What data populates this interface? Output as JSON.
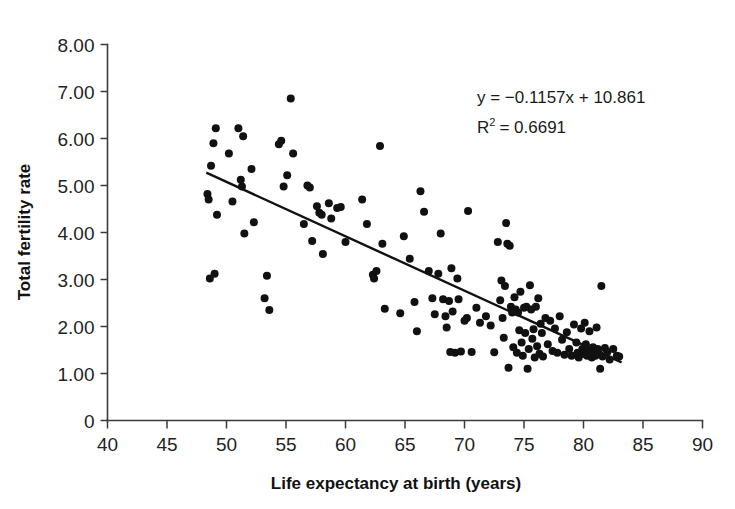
{
  "chart_data": {
    "type": "scatter",
    "title": "",
    "xlabel": "Life expectancy at birth (years)",
    "ylabel": "Total fertility rate",
    "xlim": [
      40,
      90
    ],
    "ylim": [
      0,
      8
    ],
    "xticks": [
      40,
      45,
      50,
      55,
      60,
      65,
      70,
      75,
      80,
      85,
      90
    ],
    "xtick_labels": [
      "40",
      "45",
      "50",
      "55",
      "60",
      "65",
      "70",
      "75",
      "80",
      "85",
      "90"
    ],
    "yticks": [
      0,
      1,
      2,
      3,
      4,
      5,
      6,
      7,
      8
    ],
    "ytick_labels": [
      "0",
      "1.00",
      "2.00",
      "3.00",
      "4.00",
      "5.00",
      "6.00",
      "7.00",
      "8.00"
    ],
    "grid": false,
    "legend": "none",
    "annotations": {
      "equation": "y = −0.1157x + 10.861",
      "equation_slope": -0.1157,
      "equation_intercept": 10.861,
      "r_squared_prefix": "R",
      "r_squared_exponent": "2",
      "r_squared_text": "= 0.6691",
      "r_squared_value": 0.6691
    },
    "trendline": {
      "type": "linear",
      "slope": -0.1157,
      "intercept": 10.861,
      "x_start": 48.3,
      "x_end": 83.2
    },
    "marker": {
      "shape": "circle",
      "color": "#111111",
      "size_px": 8
    },
    "points": [
      [
        48.4,
        4.82
      ],
      [
        48.5,
        4.7
      ],
      [
        48.6,
        3.02
      ],
      [
        48.7,
        5.42
      ],
      [
        48.9,
        5.9
      ],
      [
        49.0,
        3.12
      ],
      [
        49.1,
        6.22
      ],
      [
        49.2,
        4.38
      ],
      [
        50.2,
        5.68
      ],
      [
        50.5,
        4.66
      ],
      [
        51.0,
        6.22
      ],
      [
        51.2,
        5.12
      ],
      [
        51.3,
        4.98
      ],
      [
        51.4,
        6.05
      ],
      [
        51.5,
        3.98
      ],
      [
        52.1,
        5.35
      ],
      [
        52.3,
        4.22
      ],
      [
        53.2,
        2.6
      ],
      [
        53.4,
        3.08
      ],
      [
        53.6,
        2.35
      ],
      [
        54.4,
        5.88
      ],
      [
        54.6,
        5.95
      ],
      [
        54.8,
        4.98
      ],
      [
        55.1,
        5.22
      ],
      [
        55.4,
        6.85
      ],
      [
        55.6,
        5.68
      ],
      [
        56.5,
        4.18
      ],
      [
        56.8,
        5.0
      ],
      [
        57.0,
        4.96
      ],
      [
        57.2,
        3.82
      ],
      [
        57.6,
        4.56
      ],
      [
        57.8,
        4.42
      ],
      [
        58.0,
        4.38
      ],
      [
        58.1,
        3.54
      ],
      [
        58.6,
        4.62
      ],
      [
        58.8,
        4.3
      ],
      [
        59.3,
        4.52
      ],
      [
        59.6,
        4.54
      ],
      [
        60.0,
        3.8
      ],
      [
        61.4,
        4.7
      ],
      [
        61.8,
        4.18
      ],
      [
        62.3,
        3.1
      ],
      [
        62.4,
        3.02
      ],
      [
        62.6,
        3.18
      ],
      [
        62.9,
        5.84
      ],
      [
        63.1,
        3.76
      ],
      [
        63.3,
        2.38
      ],
      [
        64.6,
        2.28
      ],
      [
        64.9,
        3.92
      ],
      [
        65.4,
        3.44
      ],
      [
        65.8,
        2.52
      ],
      [
        66.0,
        1.9
      ],
      [
        66.3,
        4.88
      ],
      [
        66.6,
        4.44
      ],
      [
        67.0,
        3.18
      ],
      [
        67.3,
        2.6
      ],
      [
        67.5,
        2.26
      ],
      [
        67.8,
        3.12
      ],
      [
        68.0,
        3.98
      ],
      [
        68.2,
        2.58
      ],
      [
        68.4,
        2.22
      ],
      [
        68.5,
        1.98
      ],
      [
        68.7,
        2.54
      ],
      [
        68.8,
        1.46
      ],
      [
        68.9,
        3.24
      ],
      [
        69.0,
        2.32
      ],
      [
        69.2,
        1.44
      ],
      [
        69.4,
        3.02
      ],
      [
        69.5,
        2.58
      ],
      [
        69.7,
        1.47
      ],
      [
        70.0,
        2.12
      ],
      [
        70.2,
        2.18
      ],
      [
        70.3,
        4.46
      ],
      [
        70.6,
        1.46
      ],
      [
        71.0,
        2.4
      ],
      [
        71.3,
        2.08
      ],
      [
        71.8,
        2.22
      ],
      [
        72.2,
        2.02
      ],
      [
        72.5,
        1.45
      ],
      [
        72.8,
        3.8
      ],
      [
        73.0,
        2.56
      ],
      [
        73.1,
        2.98
      ],
      [
        73.2,
        2.18
      ],
      [
        73.3,
        1.76
      ],
      [
        73.4,
        2.86
      ],
      [
        73.5,
        4.2
      ],
      [
        73.6,
        3.76
      ],
      [
        73.7,
        1.12
      ],
      [
        73.8,
        3.72
      ],
      [
        73.9,
        2.42
      ],
      [
        74.0,
        2.3
      ],
      [
        74.1,
        1.56
      ],
      [
        74.2,
        2.62
      ],
      [
        74.3,
        2.36
      ],
      [
        74.4,
        1.44
      ],
      [
        74.5,
        2.3
      ],
      [
        74.6,
        1.92
      ],
      [
        74.7,
        2.74
      ],
      [
        74.8,
        1.66
      ],
      [
        74.9,
        1.38
      ],
      [
        75.0,
        2.4
      ],
      [
        75.1,
        1.86
      ],
      [
        75.2,
        2.42
      ],
      [
        75.3,
        1.1
      ],
      [
        75.4,
        1.52
      ],
      [
        75.5,
        2.88
      ],
      [
        75.6,
        2.36
      ],
      [
        75.7,
        1.74
      ],
      [
        75.8,
        1.94
      ],
      [
        75.9,
        1.34
      ],
      [
        76.0,
        2.42
      ],
      [
        76.1,
        1.58
      ],
      [
        76.2,
        2.6
      ],
      [
        76.3,
        1.42
      ],
      [
        76.4,
        2.06
      ],
      [
        76.5,
        1.86
      ],
      [
        76.6,
        1.36
      ],
      [
        76.8,
        2.18
      ],
      [
        77.0,
        1.62
      ],
      [
        77.2,
        2.12
      ],
      [
        77.4,
        1.48
      ],
      [
        77.6,
        1.96
      ],
      [
        77.8,
        1.44
      ],
      [
        78.0,
        2.22
      ],
      [
        78.2,
        1.72
      ],
      [
        78.4,
        1.4
      ],
      [
        78.6,
        1.88
      ],
      [
        78.8,
        1.52
      ],
      [
        79.0,
        1.38
      ],
      [
        79.2,
        2.04
      ],
      [
        79.4,
        1.66
      ],
      [
        79.5,
        1.44
      ],
      [
        79.6,
        1.34
      ],
      [
        79.8,
        1.96
      ],
      [
        79.9,
        1.52
      ],
      [
        80.0,
        1.42
      ],
      [
        80.1,
        2.08
      ],
      [
        80.2,
        1.62
      ],
      [
        80.3,
        1.38
      ],
      [
        80.4,
        1.48
      ],
      [
        80.5,
        1.9
      ],
      [
        80.6,
        1.44
      ],
      [
        80.7,
        1.34
      ],
      [
        80.8,
        1.56
      ],
      [
        80.9,
        1.46
      ],
      [
        81.0,
        1.38
      ],
      [
        81.1,
        1.98
      ],
      [
        81.2,
        1.52
      ],
      [
        81.3,
        1.42
      ],
      [
        81.4,
        1.1
      ],
      [
        81.5,
        2.86
      ],
      [
        81.6,
        1.36
      ],
      [
        81.8,
        1.54
      ],
      [
        82.0,
        1.46
      ],
      [
        82.2,
        1.3
      ],
      [
        82.5,
        1.52
      ],
      [
        82.8,
        1.38
      ],
      [
        83.0,
        1.36
      ]
    ]
  }
}
